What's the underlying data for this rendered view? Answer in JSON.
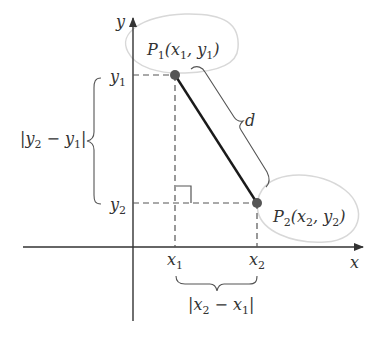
{
  "figure": {
    "type": "distance-formula-diagram",
    "colors": {
      "axis": "#333333",
      "segment": "#1a1a1a",
      "dashed": "#555555",
      "point": "#555555",
      "highlight": "#d8d8d8",
      "text": "#333333"
    },
    "axes": {
      "x_label": "x",
      "y_label": "y"
    },
    "points": [
      {
        "name": "P1",
        "label_main": "P",
        "label_sub": "1",
        "coords_text": "(x",
        "coords_sub1": "1",
        "coords_mid": ", y",
        "coords_sub2": "1",
        "coords_end": ")"
      },
      {
        "name": "P2",
        "label_main": "P",
        "label_sub": "2",
        "coords_text": "(x",
        "coords_sub1": "2",
        "coords_mid": ", y",
        "coords_sub2": "2",
        "coords_end": ")"
      }
    ],
    "ticks": {
      "x1": {
        "main": "x",
        "sub": "1"
      },
      "x2": {
        "main": "x",
        "sub": "2"
      },
      "y1": {
        "main": "y",
        "sub": "1"
      },
      "y2": {
        "main": "y",
        "sub": "2"
      }
    },
    "braces": {
      "vertical": {
        "bar_open": "|",
        "a": "y",
        "a_sub": "2",
        "minus": " − ",
        "b": "y",
        "b_sub": "1",
        "bar_close": "|"
      },
      "horizontal": {
        "bar_open": "|",
        "a": "x",
        "a_sub": "2",
        "minus": " − ",
        "b": "x",
        "b_sub": "1",
        "bar_close": "|"
      },
      "diagonal": {
        "label": "d"
      }
    }
  }
}
